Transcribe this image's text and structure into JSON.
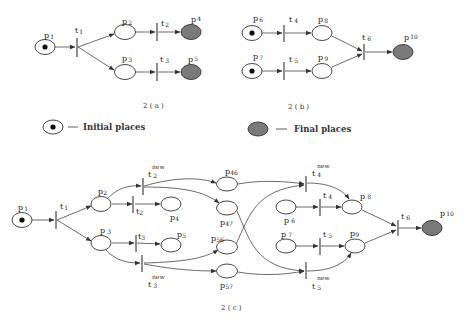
{
  "figure": {
    "subfigures": [
      {
        "caption": "2 ( a )",
        "places": [
          {
            "id": "p1",
            "label": "p",
            "sub": "1",
            "type": "initial"
          },
          {
            "id": "p2",
            "label": "p",
            "sub": "2",
            "type": "normal"
          },
          {
            "id": "p3",
            "label": "p",
            "sub": "3",
            "type": "normal"
          },
          {
            "id": "p4",
            "label": "p",
            "sub": "4",
            "type": "final"
          },
          {
            "id": "p5",
            "label": "p",
            "sub": "5",
            "type": "final"
          }
        ],
        "transitions": [
          {
            "id": "t1",
            "label": "t",
            "sub": "1"
          },
          {
            "id": "t2",
            "label": "t",
            "sub": "2"
          },
          {
            "id": "t3",
            "label": "t",
            "sub": "3"
          }
        ],
        "arcs": [
          [
            "p1",
            "t1"
          ],
          [
            "t1",
            "p2"
          ],
          [
            "t1",
            "p3"
          ],
          [
            "p2",
            "t2"
          ],
          [
            "t2",
            "p4"
          ],
          [
            "p3",
            "t3"
          ],
          [
            "t3",
            "p5"
          ]
        ]
      },
      {
        "caption": "2 ( b )",
        "places": [
          {
            "id": "p6",
            "label": "p",
            "sub": "6",
            "type": "initial"
          },
          {
            "id": "p7",
            "label": "p",
            "sub": "7",
            "type": "initial"
          },
          {
            "id": "p8",
            "label": "p",
            "sub": "8",
            "type": "normal"
          },
          {
            "id": "p9",
            "label": "p",
            "sub": "9",
            "type": "normal"
          },
          {
            "id": "p10",
            "label": "p",
            "sub": "10",
            "type": "final"
          }
        ],
        "transitions": [
          {
            "id": "t4",
            "label": "t",
            "sub": "4"
          },
          {
            "id": "t5",
            "label": "t",
            "sub": "5"
          },
          {
            "id": "t6",
            "label": "t",
            "sub": "6"
          }
        ],
        "arcs": [
          [
            "p6",
            "t4"
          ],
          [
            "t4",
            "p8"
          ],
          [
            "p7",
            "t5"
          ],
          [
            "t5",
            "p9"
          ],
          [
            "p8",
            "t6"
          ],
          [
            "p9",
            "t6"
          ],
          [
            "t6",
            "p10"
          ]
        ]
      },
      {
        "caption": "2 ( c )",
        "places": [
          {
            "id": "p1",
            "label": "p",
            "sub": "1",
            "type": "initial"
          },
          {
            "id": "p2",
            "label": "p",
            "sub": "2",
            "type": "normal"
          },
          {
            "id": "p3",
            "label": "p",
            "sub": "3",
            "type": "normal"
          },
          {
            "id": "p4",
            "label": "p",
            "sub": "4",
            "type": "normal"
          },
          {
            "id": "p5",
            "label": "p",
            "sub": "5",
            "type": "normal"
          },
          {
            "id": "p46",
            "label": "p",
            "sub": "46",
            "type": "normal"
          },
          {
            "id": "p47",
            "label": "p",
            "sub": "47",
            "type": "normal"
          },
          {
            "id": "p56",
            "label": "p",
            "sub": "56",
            "type": "normal"
          },
          {
            "id": "p57",
            "label": "p",
            "sub": "57",
            "type": "normal"
          },
          {
            "id": "p6",
            "label": "p",
            "sub": "6",
            "type": "normal"
          },
          {
            "id": "p7",
            "label": "p",
            "sub": "7",
            "type": "normal"
          },
          {
            "id": "p8",
            "label": "p",
            "sub": "8",
            "type": "normal"
          },
          {
            "id": "p9",
            "label": "p",
            "sub": "9",
            "type": "normal"
          },
          {
            "id": "p10",
            "label": "p",
            "sub": "10",
            "type": "final"
          }
        ],
        "transitions": [
          {
            "id": "t1",
            "label": "t",
            "sub": "1"
          },
          {
            "id": "t2",
            "label": "t",
            "sub": "2"
          },
          {
            "id": "t3",
            "label": "t",
            "sub": "3"
          },
          {
            "id": "t2new",
            "label": "t",
            "sub": "2",
            "sup": "new"
          },
          {
            "id": "t3new",
            "label": "t",
            "sub": "3",
            "sup": "new"
          },
          {
            "id": "t4",
            "label": "t",
            "sub": "4"
          },
          {
            "id": "t5",
            "label": "t",
            "sub": "5"
          },
          {
            "id": "t4new",
            "label": "t",
            "sub": "4",
            "sup": "new"
          },
          {
            "id": "t5new",
            "label": "t",
            "sub": "5",
            "sup": "new"
          },
          {
            "id": "t6",
            "label": "t",
            "sub": "6"
          }
        ]
      }
    ],
    "legend": {
      "initial": "Initial places",
      "final": "Final places",
      "dash": "—"
    },
    "colors": {
      "final_fill": "#7a7a7a",
      "token": "#111111",
      "stroke": "#333333"
    }
  }
}
